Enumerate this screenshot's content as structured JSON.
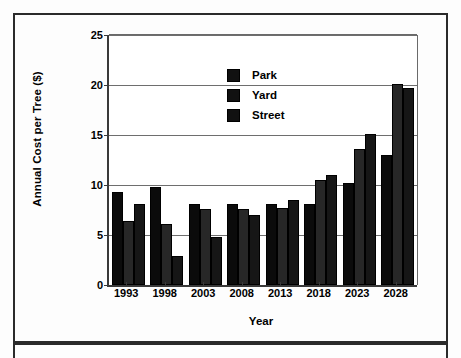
{
  "chart_data": {
    "type": "bar",
    "title": "",
    "xlabel": "Year",
    "ylabel": "Annual Cost per Tree ($)",
    "categories": [
      "1993",
      "1998",
      "2003",
      "2008",
      "2013",
      "2018",
      "2023",
      "2028"
    ],
    "series": [
      {
        "name": "Park",
        "values": [
          9.3,
          9.8,
          8.1,
          8.1,
          8.1,
          8.1,
          10.2,
          13.0
        ]
      },
      {
        "name": "Yard",
        "values": [
          6.4,
          6.1,
          7.6,
          7.6,
          7.7,
          10.5,
          13.6,
          20.1
        ]
      },
      {
        "name": "Street",
        "values": [
          8.1,
          2.9,
          4.8,
          7.0,
          8.5,
          11.0,
          15.1,
          19.7
        ]
      }
    ],
    "ylim": [
      0,
      25
    ],
    "yticks": [
      "0",
      "5",
      "10",
      "15",
      "20",
      "25"
    ],
    "ytick_values": [
      0,
      5,
      10,
      15,
      20,
      25
    ],
    "grid": "horizontal",
    "legend_position": "top-left",
    "colors": {
      "park": "#0b0b0b",
      "yard": "#272727",
      "street": "#161616",
      "axis": "#3a3a3a",
      "gridline": "#6e6e6e"
    }
  },
  "legend": {
    "entries": [
      {
        "label": "Park"
      },
      {
        "label": "Yard"
      },
      {
        "label": "Street"
      }
    ]
  }
}
